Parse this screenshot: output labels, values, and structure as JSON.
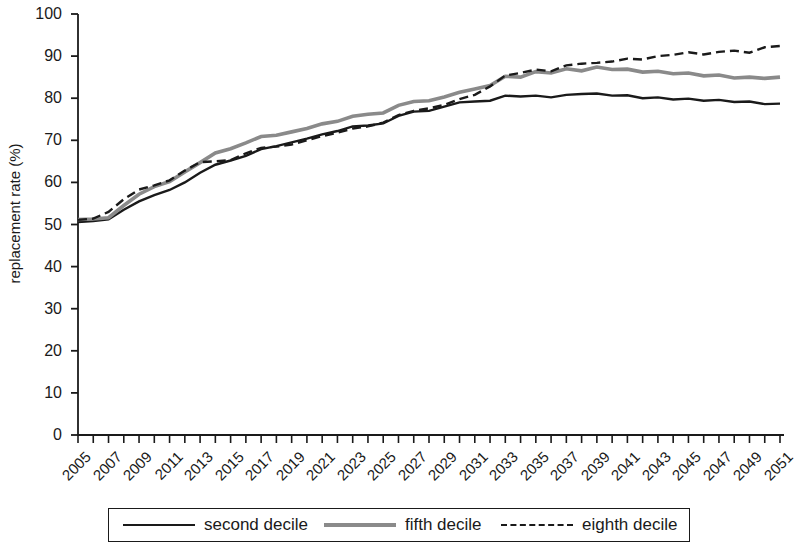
{
  "chart_data": {
    "type": "line",
    "title": "",
    "xlabel": "",
    "ylabel": "replacement rate (%)",
    "ylim": [
      0,
      100
    ],
    "yticks": [
      0,
      10,
      20,
      30,
      40,
      50,
      60,
      70,
      80,
      90,
      100
    ],
    "xlim": [
      2005,
      2051
    ],
    "xticks": [
      2005,
      2007,
      2009,
      2011,
      2013,
      2015,
      2017,
      2019,
      2021,
      2023,
      2025,
      2027,
      2029,
      2031,
      2033,
      2035,
      2037,
      2039,
      2041,
      2043,
      2045,
      2047,
      2049,
      2051
    ],
    "grid": false,
    "legend_position": "bottom",
    "x": [
      2005,
      2006,
      2007,
      2008,
      2009,
      2010,
      2011,
      2012,
      2013,
      2014,
      2015,
      2016,
      2017,
      2018,
      2019,
      2020,
      2021,
      2022,
      2023,
      2024,
      2025,
      2026,
      2027,
      2028,
      2029,
      2030,
      2031,
      2032,
      2033,
      2034,
      2035,
      2036,
      2037,
      2038,
      2039,
      2040,
      2041,
      2042,
      2043,
      2044,
      2045,
      2046,
      2047,
      2048,
      2049,
      2050,
      2051
    ],
    "series": [
      {
        "name": "second decile",
        "style": "solid",
        "color": "#1a1a1a",
        "width": 2.4,
        "values": [
          50.6,
          50.8,
          51.2,
          53.5,
          55.5,
          57.0,
          58.2,
          60.0,
          62.3,
          64.2,
          65.2,
          66.3,
          67.9,
          68.6,
          69.5,
          70.4,
          71.4,
          72.2,
          73.3,
          73.5,
          74.0,
          75.8,
          76.8,
          77.0,
          78.0,
          79.0,
          79.2,
          79.4,
          80.6,
          80.4,
          80.6,
          80.2,
          80.8,
          81.0,
          81.1,
          80.6,
          80.7,
          80.0,
          80.2,
          79.7,
          79.9,
          79.4,
          79.6,
          79.1,
          79.2,
          78.6,
          78.7
        ]
      },
      {
        "name": "fifth decile",
        "style": "solid",
        "color": "#8a8a8a",
        "width": 3.6,
        "values": [
          51.2,
          51.3,
          51.6,
          54.5,
          57.2,
          59.0,
          60.2,
          62.5,
          64.7,
          67.0,
          68.0,
          69.4,
          70.9,
          71.2,
          72.0,
          72.8,
          73.9,
          74.5,
          75.7,
          76.2,
          76.5,
          78.3,
          79.2,
          79.4,
          80.3,
          81.4,
          82.2,
          83.0,
          85.2,
          85.0,
          86.3,
          86.0,
          87.0,
          86.5,
          87.4,
          86.8,
          86.9,
          86.2,
          86.4,
          85.8,
          86.0,
          85.3,
          85.5,
          84.8,
          85.0,
          84.7,
          85.0
        ]
      },
      {
        "name": "eighth decile",
        "style": "dashed",
        "color": "#1a1a1a",
        "width": 2.4,
        "values": [
          51.1,
          51.4,
          53.0,
          56.0,
          58.3,
          59.3,
          60.5,
          62.8,
          64.8,
          65.0,
          65.3,
          66.9,
          68.2,
          68.5,
          69.0,
          70.0,
          71.0,
          71.8,
          72.8,
          73.3,
          74.2,
          76.0,
          77.0,
          77.6,
          78.4,
          79.8,
          80.8,
          82.8,
          85.4,
          86.0,
          86.8,
          86.4,
          87.8,
          88.2,
          88.4,
          88.7,
          89.4,
          89.2,
          90.0,
          90.3,
          90.9,
          90.4,
          91.0,
          91.3,
          90.8,
          92.1,
          92.4
        ]
      }
    ]
  },
  "axis": {
    "ylabel": "replacement rate (%)",
    "ytick_labels": [
      "100",
      "90",
      "80",
      "70",
      "60",
      "50",
      "40",
      "30",
      "20",
      "10",
      "0"
    ],
    "xtick_labels": [
      "2005",
      "2007",
      "2009",
      "2011",
      "2013",
      "2015",
      "2017",
      "2019",
      "2021",
      "2023",
      "2025",
      "2027",
      "2029",
      "2031",
      "2033",
      "2035",
      "2037",
      "2039",
      "2041",
      "2043",
      "2045",
      "2047",
      "2049",
      "2051"
    ]
  },
  "legend": {
    "items": [
      {
        "label": "second decile",
        "style": "solid-black"
      },
      {
        "label": "fifth decile",
        "style": "solid-gray"
      },
      {
        "label": "eighth decile",
        "style": "dashed"
      }
    ]
  },
  "colors": {
    "axis": "#1a1a1a",
    "second_decile": "#1a1a1a",
    "fifth_decile": "#8a8a8a",
    "eighth_decile": "#1a1a1a",
    "background": "#ffffff"
  }
}
